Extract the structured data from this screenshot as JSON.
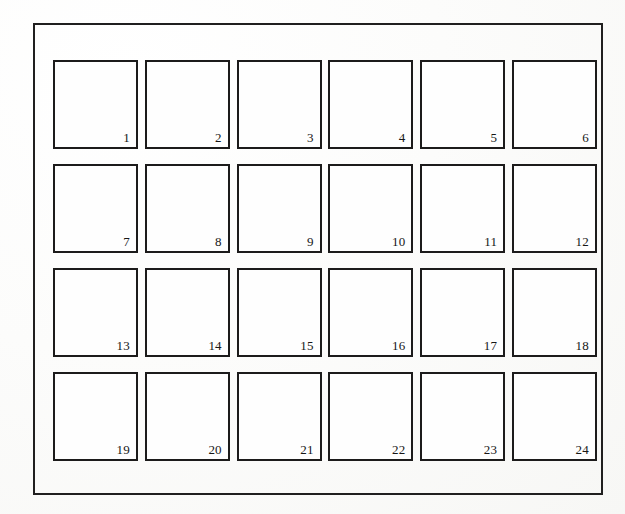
{
  "document": {
    "kind": "numbered-grid-figure",
    "background_color": "#fdfdfc",
    "ink_color": "#1c1b1b",
    "frame": {
      "border_color": "#201f1f"
    },
    "grid": {
      "columns": 6,
      "rows": 4,
      "cell_count": 24
    },
    "cells": [
      {
        "label": "1"
      },
      {
        "label": "2"
      },
      {
        "label": "3"
      },
      {
        "label": "4"
      },
      {
        "label": "5"
      },
      {
        "label": "6"
      },
      {
        "label": "7"
      },
      {
        "label": "8"
      },
      {
        "label": "9"
      },
      {
        "label": "10"
      },
      {
        "label": "11"
      },
      {
        "label": "12"
      },
      {
        "label": "13"
      },
      {
        "label": "14"
      },
      {
        "label": "15"
      },
      {
        "label": "16"
      },
      {
        "label": "17"
      },
      {
        "label": "18"
      },
      {
        "label": "19"
      },
      {
        "label": "20"
      },
      {
        "label": "21"
      },
      {
        "label": "22"
      },
      {
        "label": "23"
      },
      {
        "label": "24"
      }
    ]
  }
}
